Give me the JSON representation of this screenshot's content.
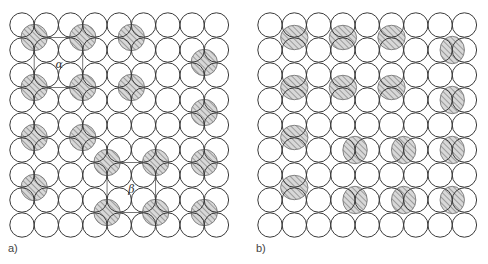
{
  "figure": {
    "width": 488,
    "height": 264,
    "grid": {
      "rows": 9,
      "cols": 9,
      "radius": 12.2,
      "col_spacing": 24.3,
      "row_spacing": 25
    },
    "colors": {
      "circle_stroke": "#3a3a3a",
      "hatch_fill": "#d8d8d8",
      "hatch_line": "#7a7a7a",
      "background": "#ffffff"
    }
  },
  "panels": [
    {
      "id": "a",
      "label": "a)",
      "label_pos": [
        8,
        252
      ],
      "origin": [
        22,
        25
      ],
      "hatch_type": "vertex",
      "hatched_sites": [
        [
          0.5,
          0.5
        ],
        [
          2.5,
          0.5
        ],
        [
          4.5,
          0.5
        ],
        [
          7.5,
          1.5
        ],
        [
          0.5,
          2.5
        ],
        [
          2.5,
          2.5
        ],
        [
          4.5,
          2.5
        ],
        [
          7.5,
          3.5
        ],
        [
          0.5,
          4.5
        ],
        [
          2.5,
          4.5
        ],
        [
          3.5,
          5.5
        ],
        [
          5.5,
          5.5
        ],
        [
          7.5,
          5.5
        ],
        [
          0.5,
          6.5
        ],
        [
          3.5,
          7.5
        ],
        [
          5.5,
          7.5
        ],
        [
          7.5,
          7.5
        ]
      ],
      "unit_cells": [
        {
          "name": "alpha",
          "symbol": "α",
          "corners": [
            [
              0.5,
              0.5
            ],
            [
              2.5,
              2.5
            ]
          ],
          "label_at": [
            1.5,
            1.55
          ]
        },
        {
          "name": "beta",
          "symbol": "β",
          "corners": [
            [
              3.5,
              5.5
            ],
            [
              5.5,
              7.5
            ]
          ],
          "label_at": [
            4.5,
            6.55
          ]
        }
      ]
    },
    {
      "id": "b",
      "label": "b)",
      "label_pos": [
        256,
        252
      ],
      "origin": [
        270,
        25
      ],
      "hatch_type": "edge",
      "hatched_sites": [
        {
          "at": [
            1,
            0.5
          ],
          "orient": "vertical"
        },
        {
          "at": [
            3,
            0.5
          ],
          "orient": "vertical"
        },
        {
          "at": [
            5,
            0.5
          ],
          "orient": "vertical"
        },
        {
          "at": [
            7.5,
            1
          ],
          "orient": "horizontal"
        },
        {
          "at": [
            1,
            2.5
          ],
          "orient": "vertical"
        },
        {
          "at": [
            3,
            2.5
          ],
          "orient": "vertical"
        },
        {
          "at": [
            5,
            2.5
          ],
          "orient": "vertical"
        },
        {
          "at": [
            7.5,
            3
          ],
          "orient": "horizontal"
        },
        {
          "at": [
            1,
            4.5
          ],
          "orient": "vertical"
        },
        {
          "at": [
            3.5,
            5
          ],
          "orient": "horizontal"
        },
        {
          "at": [
            5.5,
            5
          ],
          "orient": "horizontal"
        },
        {
          "at": [
            7.5,
            5
          ],
          "orient": "horizontal"
        },
        {
          "at": [
            1,
            6.5
          ],
          "orient": "vertical"
        },
        {
          "at": [
            3.5,
            7
          ],
          "orient": "horizontal"
        },
        {
          "at": [
            5.5,
            7
          ],
          "orient": "horizontal"
        },
        {
          "at": [
            7.5,
            7
          ],
          "orient": "horizontal"
        }
      ]
    }
  ]
}
